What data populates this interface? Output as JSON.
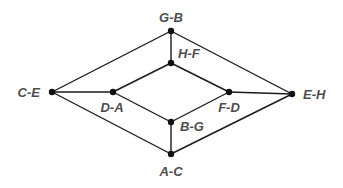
{
  "diagram": {
    "type": "graph",
    "colors": {
      "edge": "#1a1a1a",
      "node": "#111111",
      "label": "#4d4d4d",
      "background": "#ffffff"
    },
    "nodes": [
      {
        "id": "G-B",
        "label": "G-B",
        "x": 171,
        "y": 31,
        "label_x": 171,
        "label_y": 22,
        "anchor": "middle"
      },
      {
        "id": "H-F",
        "label": "H-F",
        "x": 171,
        "y": 63,
        "label_x": 178,
        "label_y": 58,
        "anchor": "start"
      },
      {
        "id": "C-E",
        "label": "C-E",
        "x": 52,
        "y": 92,
        "label_x": 40,
        "label_y": 97,
        "anchor": "end"
      },
      {
        "id": "D-A",
        "label": "D-A",
        "x": 113,
        "y": 92,
        "label_x": 112,
        "label_y": 112,
        "anchor": "middle"
      },
      {
        "id": "F-D",
        "label": "F-D",
        "x": 229,
        "y": 92,
        "label_x": 229,
        "label_y": 112,
        "anchor": "middle"
      },
      {
        "id": "E-H",
        "label": "E-H",
        "x": 292,
        "y": 94,
        "label_x": 303,
        "label_y": 99,
        "anchor": "start"
      },
      {
        "id": "B-G",
        "label": "B-G",
        "x": 171,
        "y": 122,
        "label_x": 180,
        "label_y": 131,
        "anchor": "start"
      },
      {
        "id": "A-C",
        "label": "A-C",
        "x": 171,
        "y": 154,
        "label_x": 171,
        "label_y": 176,
        "anchor": "middle"
      }
    ],
    "edges": [
      {
        "from": "G-B",
        "to": "H-F"
      },
      {
        "from": "G-B",
        "to": "C-E"
      },
      {
        "from": "G-B",
        "to": "E-H"
      },
      {
        "from": "H-F",
        "to": "D-A"
      },
      {
        "from": "H-F",
        "to": "F-D"
      },
      {
        "from": "C-E",
        "to": "D-A"
      },
      {
        "from": "C-E",
        "to": "A-C"
      },
      {
        "from": "D-A",
        "to": "B-G"
      },
      {
        "from": "F-D",
        "to": "E-H"
      },
      {
        "from": "F-D",
        "to": "B-G"
      },
      {
        "from": "E-H",
        "to": "A-C"
      },
      {
        "from": "B-G",
        "to": "A-C"
      }
    ]
  }
}
